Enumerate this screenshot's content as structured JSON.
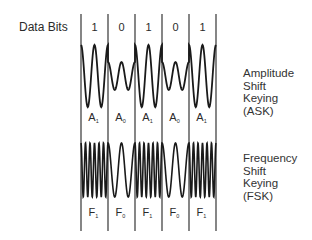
{
  "header": {
    "data_bits_label": "Data Bits"
  },
  "bits": [
    "1",
    "0",
    "1",
    "0",
    "1"
  ],
  "ask": {
    "title_lines": [
      "Amplitude",
      "Shift",
      "Keying",
      "(ASK)"
    ],
    "segment_labels": [
      {
        "base": "A",
        "sub": "1"
      },
      {
        "base": "A",
        "sub": "0"
      },
      {
        "base": "A",
        "sub": "1"
      },
      {
        "base": "A",
        "sub": "0"
      },
      {
        "base": "A",
        "sub": "1"
      }
    ]
  },
  "fsk": {
    "title_lines": [
      "Frequency",
      "Shift",
      "Keying",
      "(FSK)"
    ],
    "segment_labels": [
      {
        "base": "F",
        "sub": "1"
      },
      {
        "base": "F",
        "sub": "0"
      },
      {
        "base": "F",
        "sub": "1"
      },
      {
        "base": "F",
        "sub": "0"
      },
      {
        "base": "F",
        "sub": "1"
      }
    ]
  },
  "colors": {
    "line": "#444444",
    "wave": "#1a1a1a",
    "text": "#2a2a2a"
  }
}
